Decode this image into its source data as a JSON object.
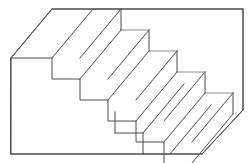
{
  "figure": {
    "name": "schroeder-staircase",
    "title": "Schroeder Staircase",
    "kind": "line-drawing",
    "canvas": {
      "width": 252,
      "height": 163,
      "background": "#ffffff"
    },
    "style": {
      "face_fill": "#ffffff",
      "stroke_dark": "#4a4a4a",
      "stroke_light": "#8a8a8a",
      "stroke_width": 1
    },
    "geometry": {
      "step_count": 6,
      "step_run_px": 28,
      "step_rise_px": 21,
      "depth_vector_px": {
        "dx": 41,
        "dy": -49
      },
      "front_top_start": {
        "x": 11,
        "y": 58
      },
      "front_bottom_left": {
        "x": 11,
        "y": 154
      },
      "back_top_left": {
        "x": 52,
        "y": 9
      },
      "back_top_right": {
        "x": 243,
        "y": 9
      },
      "back_right_bottom": {
        "x": 243,
        "y": 110
      },
      "front_bottom_right": {
        "x": 202,
        "y": 154
      }
    },
    "outline_path": "M 11 58 L 52 9 L 243 9 L 243 110 L 202 154 L 11 154 Z",
    "staircase_profile_front": [
      {
        "x": 11,
        "y": 58
      },
      {
        "x": 52,
        "y": 58
      },
      {
        "x": 52,
        "y": 79
      },
      {
        "x": 80,
        "y": 79
      },
      {
        "x": 80,
        "y": 100
      },
      {
        "x": 108,
        "y": 100
      },
      {
        "x": 108,
        "y": 112
      },
      {
        "x": 115,
        "y": 112
      },
      {
        "x": 115,
        "y": 133
      },
      {
        "x": 143,
        "y": 133
      },
      {
        "x": 143,
        "y": 154
      },
      {
        "x": 170,
        "y": 154
      }
    ],
    "tread_risers": [
      {
        "index": 1,
        "name": "step-1",
        "front_top": {
          "x": 52,
          "y": 58
        },
        "back_top": {
          "x": 93,
          "y": 9
        }
      },
      {
        "index": 2,
        "name": "step-2",
        "front_top": {
          "x": 80,
          "y": 79
        },
        "back_top": {
          "x": 121,
          "y": 30
        }
      },
      {
        "index": 3,
        "name": "step-3",
        "front_top": {
          "x": 108,
          "y": 100
        },
        "back_top": {
          "x": 149,
          "y": 51
        }
      },
      {
        "index": 4,
        "name": "step-4",
        "front_top": {
          "x": 136,
          "y": 121
        },
        "back_top": {
          "x": 177,
          "y": 72
        }
      },
      {
        "index": 5,
        "name": "step-5",
        "front_top": {
          "x": 164,
          "y": 142
        },
        "back_top": {
          "x": 205,
          "y": 93
        }
      },
      {
        "index": 6,
        "name": "step-6",
        "front_top": {
          "x": 192,
          "y": 163
        },
        "back_top": {
          "x": 233,
          "y": 114
        }
      }
    ]
  }
}
